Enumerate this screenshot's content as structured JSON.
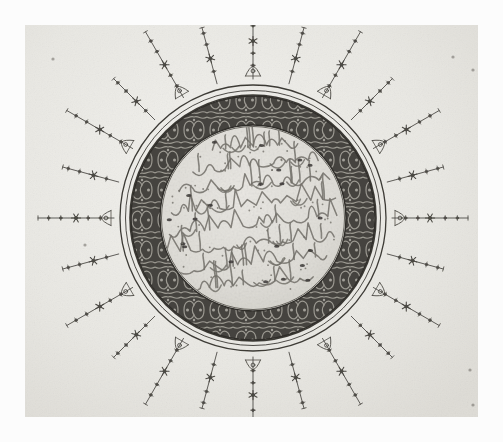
{
  "artwork": {
    "domain_kind": "archival-photograph",
    "medium_note": "monochrome photographic reproduction",
    "object_type": "illuminated calligraphic roundel (sunburst / semse medallion)",
    "script": "Arabic thuluth calligraphy",
    "tradition": "Ottoman illumination (tezhip)",
    "caption": ""
  },
  "canvas": {
    "width": 503,
    "height": 442,
    "mount_color": "#fcfcfc",
    "paper": {
      "x": 25,
      "y": 25,
      "width": 453,
      "height": 392,
      "color": "#ecebe7",
      "edge_color": "#d8d6d0"
    }
  },
  "medallion": {
    "center_x": 228,
    "center_y": 193,
    "ring_outer_radius": 133,
    "ring_outer2_radius": 127,
    "band_outer_radius": 122,
    "band_inner_radius": 93,
    "field_radius": 91,
    "band_color": "#4f4d49",
    "band_pattern": "arabesque-rumi-scroll",
    "field_color": "#e3e1dc",
    "line_color": "#3a3833",
    "ring_line_width": 1.2
  },
  "rays": {
    "count": 24,
    "angle_step_degrees": 15,
    "inner_start_radius": 139,
    "long_length": 76,
    "short_length": 58,
    "node_glyphs": [
      "six-point-star",
      "dot",
      "lotus-palmette"
    ],
    "stroke_color": "#4a4843"
  },
  "calligraphy": {
    "line_count": 8,
    "opening_phrase": "Bismillah al-Rahman al-Rahim",
    "ink_color": "#6e6b64",
    "lines": [
      "بسم الله الرحمن الرحيم",
      "اعظم الخاقان الاجل",
      "الاكرم ملك البر و البحرين",
      "الغازي ولي النعم لنا",
      "السلطان بن السلطان",
      "خان خلد الله ملكه",
      "و سلطانه و ابد دولته",
      "الى يوم القيامة"
    ]
  },
  "marks": {
    "pencil_annotations": [
      {
        "name": "corner-dot-top-left",
        "x": 28,
        "y": 34
      },
      {
        "name": "corner-dot-top-right",
        "x": 428,
        "y": 32
      },
      {
        "name": "edge-mark-right-upper",
        "x": 448,
        "y": 45
      },
      {
        "name": "edge-mark-right-lower",
        "x": 445,
        "y": 345
      },
      {
        "name": "edge-mark-right-bottom",
        "x": 448,
        "y": 380
      },
      {
        "name": "field-stroke-left",
        "x": 60,
        "y": 220
      }
    ]
  }
}
